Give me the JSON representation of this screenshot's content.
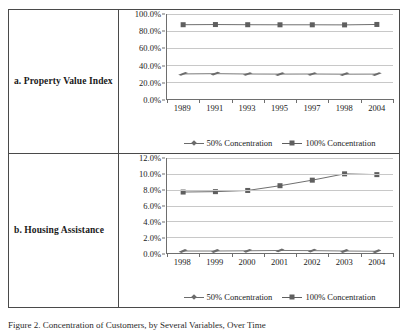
{
  "figure": {
    "caption": "Figure 2.  Concentration of Customers, by Several Variables, Over Time"
  },
  "rows": [
    {
      "label": "a. Property Value Index",
      "chart_data": {
        "type": "line",
        "title": "",
        "xlabel": "",
        "ylabel": "",
        "categories": [
          "1989",
          "1991",
          "1993",
          "1995",
          "1997",
          "1998",
          "2004"
        ],
        "ylim": [
          0,
          100
        ],
        "ytick_labels": [
          "0.0%",
          "20.0%",
          "40.0%",
          "60.0%",
          "80.0%",
          "100.0%"
        ],
        "ytick_values": [
          0,
          20,
          40,
          60,
          80,
          100
        ],
        "grid": true,
        "legend_position": "bottom",
        "series": [
          {
            "name": "50% Concentration",
            "marker": "diamond",
            "color": "#6b6b6b",
            "values": [
              29.5,
              29.8,
              29.4,
              29.3,
              29.4,
              29.2,
              29.3
            ]
          },
          {
            "name": "100% Concentration",
            "marker": "square",
            "color": "#5f5f5f",
            "values": [
              87.4,
              87.6,
              87.4,
              87.3,
              87.3,
              87.2,
              87.7
            ]
          }
        ]
      }
    },
    {
      "label": "b. Housing Assistance",
      "chart_data": {
        "type": "line",
        "title": "",
        "xlabel": "",
        "ylabel": "",
        "categories": [
          "1998",
          "1999",
          "2000",
          "2001",
          "2002",
          "2003",
          "2004"
        ],
        "ylim": [
          0,
          12
        ],
        "ytick_labels": [
          "0.0%",
          "2.0%",
          "4.0%",
          "6.0%",
          "8.0%",
          "10.0%",
          "12.0%"
        ],
        "ytick_values": [
          0,
          2,
          4,
          6,
          8,
          10,
          12
        ],
        "grid": true,
        "legend_position": "bottom",
        "series": [
          {
            "name": "50% Concentration",
            "marker": "diamond",
            "color": "#6b6b6b",
            "values": [
              0.25,
              0.25,
              0.28,
              0.32,
              0.3,
              0.25,
              0.22
            ]
          },
          {
            "name": "100% Concentration",
            "marker": "square",
            "color": "#5f5f5f",
            "values": [
              7.7,
              7.75,
              7.9,
              8.5,
              9.2,
              10.0,
              9.9
            ]
          }
        ]
      }
    }
  ]
}
